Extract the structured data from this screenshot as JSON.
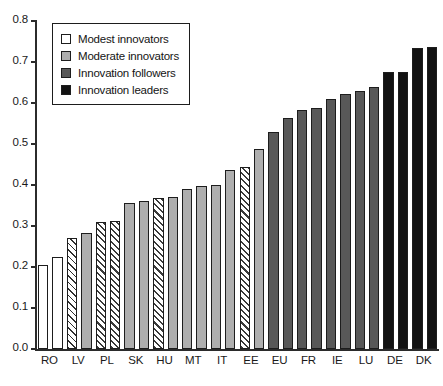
{
  "chart_data": {
    "type": "bar",
    "title": "",
    "xlabel": "",
    "ylabel": "",
    "ylim": [
      0.0,
      0.8
    ],
    "ytick_labels": [
      "0.0",
      "0.1",
      "0.2",
      "0.3",
      "0.4",
      "0.5",
      "0.6",
      "0.7",
      "0.8"
    ],
    "ytick_values": [
      0.0,
      0.1,
      0.2,
      0.3,
      0.4,
      0.5,
      0.6,
      0.7,
      0.8
    ],
    "grid": false,
    "legend_position": "top-left",
    "categories": [
      "RO",
      "LV",
      "PL",
      "SK",
      "HU",
      "MT",
      "IT",
      "EE",
      "EU",
      "FR",
      "IE",
      "LU",
      "DE",
      "DK"
    ],
    "legend": [
      {
        "label": "Modest innovators",
        "color": "#ffffff",
        "pattern": "solid"
      },
      {
        "label": "Moderate innovators",
        "color": "#aeaeae",
        "pattern": "solid"
      },
      {
        "label": "Innovation followers",
        "color": "#585858",
        "pattern": "solid"
      },
      {
        "label": "Innovation leaders",
        "color": "#121212",
        "pattern": "solid"
      }
    ],
    "bars": [
      {
        "label": "RO",
        "value": 0.205,
        "group": "Modest innovators",
        "fill": "white"
      },
      {
        "label": "RO",
        "value": 0.225,
        "group": "Modest innovators",
        "fill": "white"
      },
      {
        "label": "LV",
        "value": 0.27,
        "group": "Modest innovators",
        "fill": "white-hatch"
      },
      {
        "label": "LV",
        "value": 0.283,
        "group": "Moderate innovators",
        "fill": "gray"
      },
      {
        "label": "PL",
        "value": 0.31,
        "group": "Moderate innovators",
        "fill": "gray-hatch"
      },
      {
        "label": "PL",
        "value": 0.313,
        "group": "Moderate innovators",
        "fill": "gray-hatch"
      },
      {
        "label": "SK",
        "value": 0.357,
        "group": "Moderate innovators",
        "fill": "gray"
      },
      {
        "label": "SK",
        "value": 0.36,
        "group": "Moderate innovators",
        "fill": "gray"
      },
      {
        "label": "HU",
        "value": 0.368,
        "group": "Moderate innovators",
        "fill": "gray-hatch"
      },
      {
        "label": "HU",
        "value": 0.37,
        "group": "Moderate innovators",
        "fill": "gray"
      },
      {
        "label": "MT",
        "value": 0.39,
        "group": "Moderate innovators",
        "fill": "gray"
      },
      {
        "label": "MT",
        "value": 0.397,
        "group": "Moderate innovators",
        "fill": "gray"
      },
      {
        "label": "IT",
        "value": 0.4,
        "group": "Moderate innovators",
        "fill": "gray"
      },
      {
        "label": "IT",
        "value": 0.437,
        "group": "Moderate innovators",
        "fill": "gray"
      },
      {
        "label": "EE",
        "value": 0.443,
        "group": "Moderate innovators",
        "fill": "gray-hatch"
      },
      {
        "label": "EE",
        "value": 0.487,
        "group": "Moderate innovators",
        "fill": "gray"
      },
      {
        "label": "EU",
        "value": 0.53,
        "group": "Innovation followers",
        "fill": "dark"
      },
      {
        "label": "EU",
        "value": 0.563,
        "group": "Innovation followers",
        "fill": "dark"
      },
      {
        "label": "FR",
        "value": 0.583,
        "group": "Innovation followers",
        "fill": "dark"
      },
      {
        "label": "FR",
        "value": 0.587,
        "group": "Innovation followers",
        "fill": "dark"
      },
      {
        "label": "IE",
        "value": 0.61,
        "group": "Innovation followers",
        "fill": "dark"
      },
      {
        "label": "IE",
        "value": 0.622,
        "group": "Innovation followers",
        "fill": "dark"
      },
      {
        "label": "LU",
        "value": 0.63,
        "group": "Innovation followers",
        "fill": "dark"
      },
      {
        "label": "LU",
        "value": 0.64,
        "group": "Innovation followers",
        "fill": "dark"
      },
      {
        "label": "DE",
        "value": 0.675,
        "group": "Innovation leaders",
        "fill": "black"
      },
      {
        "label": "DE",
        "value": 0.675,
        "group": "Innovation leaders",
        "fill": "black"
      },
      {
        "label": "DK",
        "value": 0.735,
        "group": "Innovation leaders",
        "fill": "black"
      },
      {
        "label": "DK",
        "value": 0.737,
        "group": "Innovation leaders",
        "fill": "black"
      }
    ]
  }
}
